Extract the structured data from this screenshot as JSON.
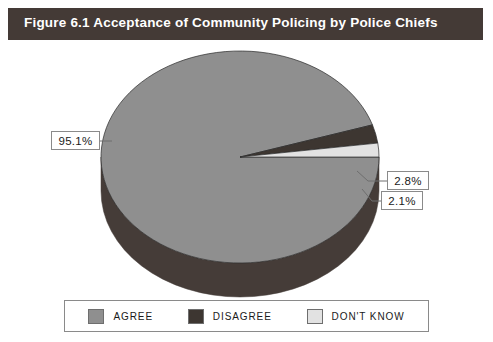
{
  "figure": {
    "title": "Figure 6.1  Acceptance of Community Policing by Police Chiefs",
    "title_bar_color": "#443a36",
    "title_text_color": "#ffffff",
    "background_color": "#ffffff"
  },
  "chart_data": {
    "type": "pie",
    "title": "Figure 6.1  Acceptance of Community Policing by Police Chiefs",
    "xlabel": "",
    "ylabel": "",
    "categories": [
      "AGREE",
      "DISAGREE",
      "DON'T KNOW"
    ],
    "values": [
      95.1,
      2.8,
      2.1
    ],
    "value_labels": [
      "95.1%",
      "2.8%",
      "2.1%"
    ],
    "colors": [
      "#8f8f8f",
      "#3d3631",
      "#e2e2e2"
    ],
    "side_colors": [
      "#453c38",
      "#241f1c",
      "#9c9c9c"
    ],
    "legend_position": "bottom",
    "grid": false,
    "three_d": true,
    "start_angle_deg": 0,
    "direction": "clockwise",
    "units": "percent"
  },
  "callouts": [
    {
      "name": "agree",
      "text": "95.1%"
    },
    {
      "name": "disagree",
      "text": "2.8%"
    },
    {
      "name": "dontknow",
      "text": "2.1%"
    }
  ],
  "legend": {
    "items": [
      {
        "label": "AGREE",
        "color": "#8f8f8f"
      },
      {
        "label": "DISAGREE",
        "color": "#3d3631"
      },
      {
        "label": "DON'T KNOW",
        "color": "#e2e2e2"
      }
    ]
  }
}
